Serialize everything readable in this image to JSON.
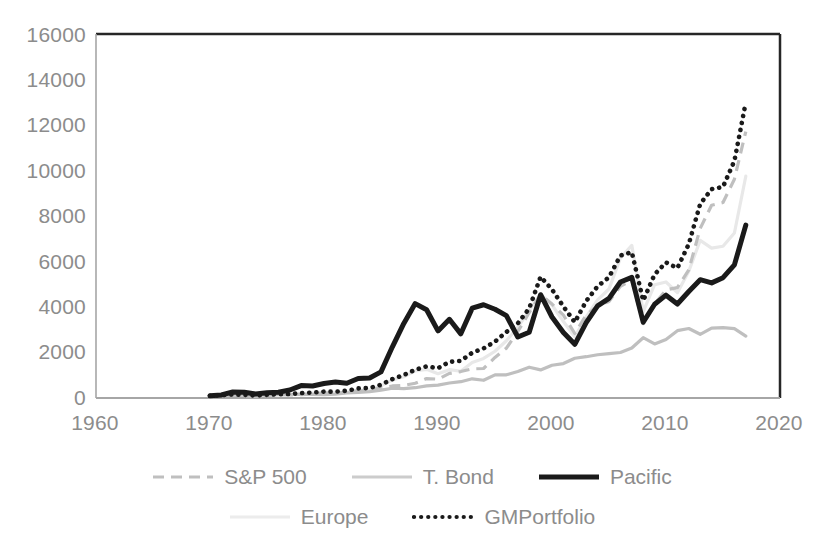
{
  "chart_data": {
    "type": "line",
    "title": "",
    "subtitle": "",
    "xlabel": "",
    "ylabel": "",
    "xlim": [
      1960,
      2020
    ],
    "ylim": [
      0,
      16000
    ],
    "xticks": [
      "1960",
      "1970",
      "1980",
      "1990",
      "2000",
      "2010",
      "2020"
    ],
    "yticks": [
      "0",
      "2000",
      "4000",
      "6000",
      "8000",
      "10000",
      "12000",
      "14000",
      "16000"
    ],
    "grid": false,
    "legend_position": "bottom",
    "x": [
      1970,
      1971,
      1972,
      1973,
      1974,
      1975,
      1976,
      1977,
      1978,
      1979,
      1980,
      1981,
      1982,
      1983,
      1984,
      1985,
      1986,
      1987,
      1988,
      1989,
      1990,
      1991,
      1992,
      1993,
      1994,
      1995,
      1996,
      1997,
      1998,
      1999,
      2000,
      2001,
      2002,
      2003,
      2004,
      2005,
      2006,
      2007,
      2008,
      2009,
      2010,
      2011,
      2012,
      2013,
      2014,
      2015,
      2016,
      2017
    ],
    "series": [
      {
        "name": "S&P 500",
        "style": "dashed",
        "color": "#bfbfbf",
        "values": [
          100,
          114,
          136,
          116,
          85,
          117,
          145,
          135,
          143,
          170,
          225,
          214,
          260,
          319,
          339,
          446,
          529,
          557,
          649,
          854,
          828,
          1080,
          1162,
          1279,
          1296,
          1782,
          2190,
          2921,
          3756,
          4546,
          4131,
          3641,
          2836,
          3649,
          4046,
          4244,
          4913,
          5183,
          3266,
          4131,
          4753,
          4853,
          5630,
          7454,
          8473,
          8591,
          9617,
          11713
        ]
      },
      {
        "name": "T. Bond",
        "style": "solid-light",
        "color": "#bfbfbf",
        "values": [
          100,
          113,
          116,
          120,
          125,
          134,
          156,
          158,
          157,
          158,
          152,
          168,
          222,
          241,
          278,
          347,
          428,
          416,
          452,
          534,
          567,
          658,
          716,
          843,
          779,
          1019,
          1019,
          1162,
          1353,
          1234,
          1441,
          1514,
          1748,
          1815,
          1900,
          1954,
          2000,
          2200,
          2650,
          2375,
          2575,
          2960,
          3055,
          2800,
          3075,
          3090,
          3050,
          2720
        ]
      },
      {
        "name": "Pacific",
        "style": "solid-bold",
        "color": "#1a1a1a",
        "values": [
          100,
          135,
          265,
          250,
          175,
          230,
          255,
          350,
          545,
          530,
          640,
          700,
          650,
          860,
          880,
          1150,
          2250,
          3280,
          4150,
          3880,
          2950,
          3460,
          2820,
          3950,
          4100,
          3900,
          3620,
          2680,
          2890,
          4540,
          3560,
          2880,
          2360,
          3310,
          4050,
          4380,
          5100,
          5300,
          3330,
          4120,
          4520,
          4130,
          4680,
          5200,
          5060,
          5290,
          5850,
          7600
        ]
      },
      {
        "name": "Europe",
        "style": "solid-faint",
        "color": "#e8e8e8",
        "values": [
          100,
          110,
          130,
          118,
          88,
          120,
          122,
          148,
          190,
          210,
          250,
          235,
          245,
          340,
          345,
          535,
          795,
          935,
          1195,
          1260,
          1070,
          1245,
          1175,
          1565,
          1740,
          2055,
          2515,
          3110,
          3850,
          4560,
          4090,
          3360,
          2690,
          3570,
          4310,
          4790,
          6150,
          6710,
          3800,
          4980,
          5100,
          4630,
          5570,
          6930,
          6590,
          6670,
          7250,
          9750
        ]
      },
      {
        "name": "GMPortfolio",
        "style": "dotted",
        "color": "#1a1a1a",
        "values": [
          100,
          120,
          155,
          140,
          105,
          140,
          160,
          175,
          215,
          240,
          280,
          280,
          320,
          420,
          440,
          580,
          830,
          1010,
          1240,
          1390,
          1310,
          1590,
          1630,
          1990,
          2180,
          2480,
          2900,
          3280,
          3940,
          5330,
          4770,
          4020,
          3330,
          4260,
          4910,
          5310,
          6260,
          6410,
          4280,
          5430,
          5960,
          5710,
          6770,
          8530,
          9180,
          9280,
          10420,
          13000
        ]
      }
    ]
  },
  "legend": {
    "items": [
      {
        "label": "S&P 500",
        "swatch": "dashed-swatch"
      },
      {
        "label": "T. Bond",
        "swatch": "solid-light-swatch"
      },
      {
        "label": "Pacific",
        "swatch": "solid-bold-swatch"
      },
      {
        "label": "Europe",
        "swatch": "solid-faint-swatch"
      },
      {
        "label": "GMPortfolio",
        "swatch": "dotted-swatch"
      }
    ]
  },
  "axes": {
    "y_tick_labels": [
      "16000",
      "14000",
      "12000",
      "10000",
      "8000",
      "6000",
      "4000",
      "2000",
      "0"
    ],
    "x_tick_labels": [
      "1960",
      "1970",
      "1980",
      "1990",
      "2000",
      "2010",
      "2020"
    ]
  },
  "colors": {
    "axis_line": "#7f7f7f",
    "plot_frame": "#262626",
    "tick_text": "#8c8c8c",
    "series_black": "#1a1a1a",
    "series_gray": "#bfbfbf",
    "series_faint": "#e8e8e8",
    "background": "#ffffff"
  }
}
